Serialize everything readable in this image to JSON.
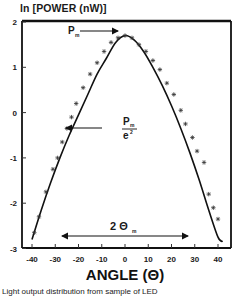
{
  "chart_data": {
    "type": "line",
    "title": "",
    "ylabel": "ln [POWER (nW)]",
    "xlabel": "ANGLE (Θ)",
    "xlim": [
      -44,
      44
    ],
    "ylim": [
      -3,
      2
    ],
    "xticks": [
      -40,
      -30,
      -20,
      -10,
      0,
      10,
      20,
      30,
      40
    ],
    "yticks": [
      2,
      1,
      0,
      -1,
      -2,
      -3
    ],
    "grid": false,
    "legend": null,
    "series": [
      {
        "name": "fit",
        "style": "solid line",
        "x": [
          -40,
          -36,
          -32,
          -28,
          -24,
          -20,
          -16,
          -12,
          -8,
          -4,
          0,
          4,
          8,
          12,
          16,
          20,
          24,
          28,
          32,
          36,
          40,
          42
        ],
        "y": [
          -2.8,
          -2.15,
          -1.55,
          -1.0,
          -0.5,
          -0.05,
          0.4,
          0.85,
          1.2,
          1.55,
          1.7,
          1.6,
          1.35,
          1.0,
          0.6,
          0.15,
          -0.35,
          -0.9,
          -1.5,
          -2.15,
          -2.75,
          -2.85
        ]
      },
      {
        "name": "measured",
        "style": "star markers",
        "x": [
          -39,
          -37,
          -34,
          -31,
          -29,
          -27,
          -25,
          -23,
          -21,
          -18,
          -15,
          -12,
          -9,
          -6,
          -3,
          0,
          3,
          6,
          9,
          12,
          15,
          18,
          21,
          24,
          26,
          29,
          31,
          34,
          36,
          38,
          40
        ],
        "y": [
          -2.65,
          -2.3,
          -1.75,
          -1.25,
          -1.0,
          -0.65,
          -0.35,
          -0.1,
          0.2,
          0.55,
          0.85,
          1.1,
          1.35,
          1.55,
          1.65,
          1.7,
          1.65,
          1.5,
          1.35,
          1.15,
          0.95,
          0.65,
          0.4,
          0.05,
          -0.25,
          -0.55,
          -0.85,
          -1.1,
          -1.8,
          -2.1,
          -2.35
        ]
      }
    ],
    "annotations": [
      {
        "text": "P",
        "subscript": "m",
        "type": "arrow",
        "from_x": -19,
        "to_x": -4,
        "y": 1.88,
        "label_x": -27,
        "label_y": 1.88
      },
      {
        "text": "P",
        "subscript": "m",
        "denominator": "e",
        "denominator_sup": "2",
        "type": "arrow",
        "from_x": -8,
        "to_x": -26,
        "y": -0.3,
        "label_x": 2,
        "label_y": -0.3
      },
      {
        "text": "2 Θ",
        "subscript": "m",
        "type": "double-arrow",
        "from_x": -28,
        "to_x": 28,
        "y": -2.7,
        "label_x": 0,
        "label_y": -2.45
      }
    ]
  },
  "labels": {
    "y_axis_title": "ln [POWER (nW)]",
    "x_axis_title": "ANGLE (Θ)",
    "caption": "Light output distribution from sample of LED",
    "pm": "P",
    "pm_sub": "m",
    "pe_num": "P",
    "pe_sub": "m",
    "pe_den": "e",
    "pe_sup": "2",
    "theta": "2 Θ",
    "theta_sub": "m"
  }
}
